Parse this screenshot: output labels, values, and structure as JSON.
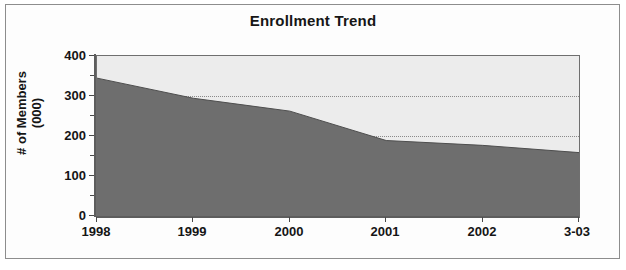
{
  "figure": {
    "title": "Enrollment Trend"
  },
  "chart_data": {
    "type": "area",
    "title": "Enrollment Trend",
    "xlabel": "",
    "ylabel": "# of Members (000)",
    "ylabel_line1": "# of Members",
    "ylabel_line2": "(000)",
    "categories": [
      "1998",
      "1999",
      "2000",
      "2001",
      "2002",
      "3-03"
    ],
    "x_tick_labels": [
      "1998",
      "1999",
      "2000",
      "2001",
      "2002",
      "3-03"
    ],
    "y_tick_labels": [
      "0",
      "100",
      "200",
      "300",
      "400"
    ],
    "y_tick_values": [
      0,
      100,
      200,
      300,
      400
    ],
    "ylim": [
      0,
      400
    ],
    "values": [
      345,
      295,
      263,
      190,
      178,
      160
    ],
    "series": [
      {
        "name": "# of Members (000)",
        "values": [
          345,
          295,
          263,
          190,
          178,
          160
        ],
        "fill_color": "#6e6e6e"
      }
    ],
    "background_band_color": "#ececec",
    "grid": true,
    "gridlines_at": [
      200,
      300
    ],
    "legend": false,
    "legend_position": "none"
  },
  "colors": {
    "area_fill": "#6e6e6e",
    "plot_background": "#ececec",
    "axis": "#5d5d5d",
    "grid": "#8a8a8a",
    "text": "#151515",
    "frame": "#8d8d8d"
  }
}
